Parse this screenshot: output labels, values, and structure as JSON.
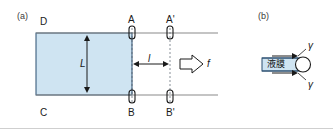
{
  "figure": {
    "panel_a": {
      "tag": "(a)",
      "corner_labels": {
        "top_left": "D",
        "bottom_left": "C",
        "bar_left_top": "A",
        "bar_left_bottom": "B",
        "bar_right_top": "A'",
        "bar_right_bottom": "B'"
      },
      "dimension_vertical": "L",
      "dimension_horizontal": "l",
      "force_label": "f",
      "film_fill_color": "#cfe4f2",
      "film_edge_color": "#2b4f70",
      "rail_color": "#8a8a8a",
      "bar_color": "#1a1a1a"
    },
    "panel_b": {
      "tag": "(b)",
      "film_label": "液膜",
      "surface_tension_top": "γ",
      "surface_tension_bottom": "γ",
      "film_fill_color": "#cfe4f2",
      "film_edge_color": "#2b4f70"
    }
  }
}
